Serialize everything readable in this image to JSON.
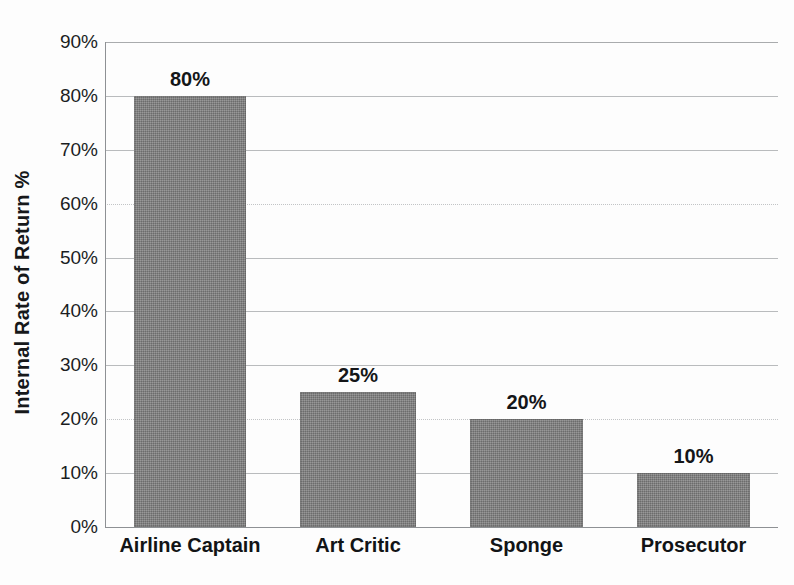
{
  "chart_data": {
    "type": "bar",
    "title": "",
    "xlabel": "",
    "ylabel": "Internal Rate of Return %",
    "categories": [
      "Airline Captain",
      "Art Critic",
      "Sponge",
      "Prosecutor"
    ],
    "values": [
      80,
      25,
      20,
      10
    ],
    "value_labels": [
      "80%",
      "25%",
      "20%",
      "10%"
    ],
    "ylim": [
      0,
      90
    ],
    "ytick_values": [
      0,
      10,
      20,
      30,
      40,
      50,
      60,
      70,
      80,
      90
    ],
    "ytick_labels": [
      "0%",
      "10%",
      "20%",
      "30%",
      "40%",
      "50%",
      "60%",
      "70%",
      "80%",
      "90%"
    ],
    "grid": true,
    "legend": null,
    "bar_color": "#7e7e7e",
    "gridline_color": "#b9bbbd",
    "axis_color": "#8e9194",
    "background_color": "#fdfdfd",
    "text_color": "#141618"
  }
}
